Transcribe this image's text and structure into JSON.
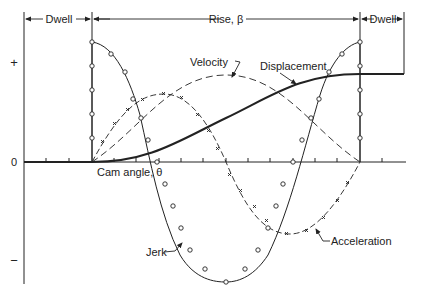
{
  "diagram": {
    "type": "cam-follower-motion-diagram",
    "intervals": {
      "dwell_left": "Dwell",
      "rise": "Rise, β",
      "dwell_right": "Dwell"
    },
    "axis": {
      "y_plus": "+",
      "y_zero": "0",
      "y_minus": "−",
      "x_label": "Cam angle, θ"
    },
    "curves": {
      "displacement": "Displacement",
      "velocity": "Velocity",
      "acceleration": "Acceleration",
      "jerk": "Jerk"
    },
    "colors": {
      "ink": "#222222",
      "background": "#ffffff"
    }
  }
}
